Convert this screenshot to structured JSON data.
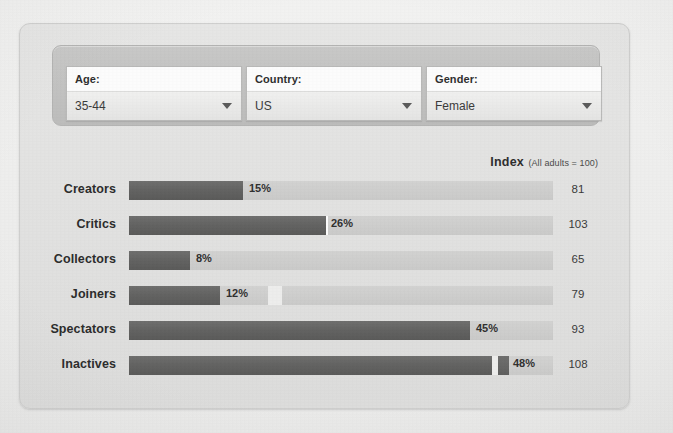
{
  "filters": [
    {
      "name": "age",
      "label": "Age:",
      "value": "35-44",
      "caret": "chevron-down-icon"
    },
    {
      "name": "country",
      "label": "Country:",
      "value": "US",
      "caret": "chevron-down-icon"
    },
    {
      "name": "gender",
      "label": "Gender:",
      "value": "Female",
      "caret": "chevron-down-icon"
    }
  ],
  "index_header": {
    "title": "Index",
    "note": "(All adults = 100)"
  },
  "colors": {
    "page_bg": "#efefef",
    "card_bg": "#e2e2e1",
    "filter_panel": "#c4c4c3",
    "bar_fill": "#636362",
    "bar_track": "#cecece",
    "text": "#2c2c2c"
  },
  "chart_data": {
    "type": "bar",
    "xlabel": "",
    "ylabel": "",
    "orientation": "horizontal",
    "xlim": [
      0,
      56
    ],
    "grid": false,
    "legend": null,
    "value_suffix": "%",
    "index_baseline": 100,
    "categories": [
      "Creators",
      "Critics",
      "Collectors",
      "Joiners",
      "Spectators",
      "Inactives"
    ],
    "values": [
      15,
      26,
      8,
      12,
      45,
      48
    ],
    "value_labels": [
      "15%",
      "26%",
      "8%",
      "12%",
      "45%",
      "48%"
    ],
    "index_values": [
      81,
      103,
      65,
      79,
      93,
      108
    ],
    "series": [
      {
        "name": "Percent of online adults",
        "values": [
          15,
          26,
          8,
          12,
          45,
          48
        ]
      },
      {
        "name": "Index (All adults = 100)",
        "values": [
          81,
          103,
          65,
          79,
          93,
          108
        ]
      }
    ]
  }
}
